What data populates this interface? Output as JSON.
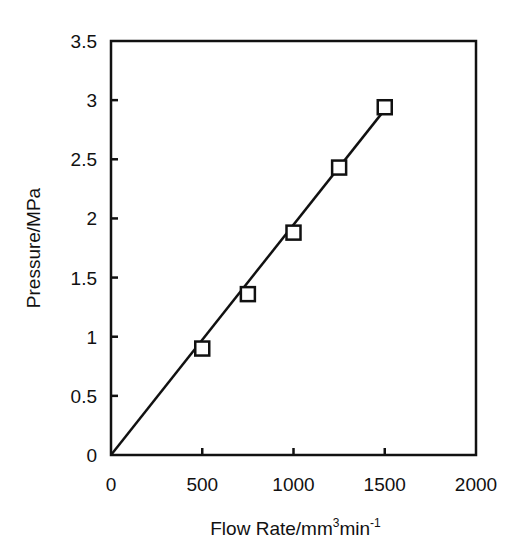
{
  "chart_data": {
    "type": "scatter",
    "title": "",
    "xlabel": "Flow Rate/mm3min-1",
    "xlabel_parts": {
      "base": "Flow Rate/mm",
      "sup1": "3",
      "mid": "min",
      "sup2": "-1"
    },
    "ylabel": "Pressure/MPa",
    "xlim": [
      0,
      2000
    ],
    "ylim": [
      0,
      3.5
    ],
    "xticks": [
      0,
      500,
      1000,
      1500,
      2000
    ],
    "xtick_labels": [
      "0",
      "500",
      "1000",
      "1500",
      "2000"
    ],
    "yticks": [
      0,
      0.5,
      1,
      1.5,
      2,
      2.5,
      3,
      3.5
    ],
    "ytick_labels": [
      "0",
      "0.5",
      "1",
      "1.5",
      "2",
      "2.5",
      "3",
      "3.5"
    ],
    "grid": false,
    "legend": null,
    "series": [
      {
        "name": "measured",
        "marker": "open-square",
        "x": [
          500,
          750,
          1000,
          1250,
          1500
        ],
        "y": [
          0.9,
          1.36,
          1.88,
          2.43,
          2.94
        ]
      },
      {
        "name": "linear-fit",
        "style": "line",
        "x": [
          0,
          1500
        ],
        "y": [
          0,
          2.92
        ]
      }
    ]
  }
}
